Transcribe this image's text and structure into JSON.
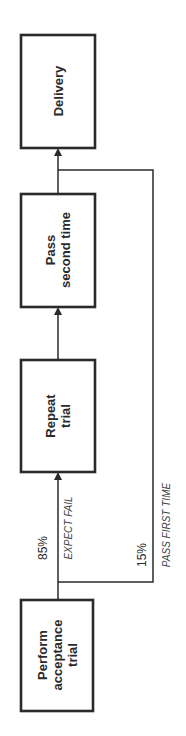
{
  "diagram": {
    "type": "flowchart",
    "orientation": "rotated-90-ccw",
    "nodes": [
      {
        "id": "perform",
        "lines": [
          "Perform",
          "acceptance",
          "trial"
        ]
      },
      {
        "id": "repeat",
        "lines": [
          "Repeat",
          "trial"
        ]
      },
      {
        "id": "pass2",
        "lines": [
          "Pass",
          "second time"
        ]
      },
      {
        "id": "delivery",
        "lines": [
          "Delivery"
        ]
      }
    ],
    "edges": [
      {
        "from": "perform",
        "to": "repeat",
        "percent": "85%",
        "label": "EXPECT FAIL"
      },
      {
        "from": "repeat",
        "to": "pass2"
      },
      {
        "from": "pass2",
        "to": "delivery"
      },
      {
        "from": "perform",
        "to": "delivery",
        "percent": "15%",
        "label": "PASS FIRST TIME"
      }
    ]
  }
}
